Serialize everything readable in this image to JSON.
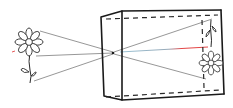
{
  "diagram": {
    "title": "",
    "objects": [
      {
        "id": "object-flower",
        "orientation": "upright",
        "position": "left"
      },
      {
        "id": "image-flower",
        "orientation": "inverted",
        "position": "back-screen"
      }
    ],
    "rays": [
      {
        "from": "flower-top",
        "to": "image-bottom"
      },
      {
        "from": "flower-center",
        "to": "image-center",
        "highlight": true
      },
      {
        "from": "flower-stem-base",
        "to": "image-top"
      }
    ],
    "colors": {
      "outline": "#1a1a1a",
      "ray": "#6a6a6a",
      "central_ray_start": "#7fb0c8",
      "central_ray_end": "#e03030",
      "background": "#ffffff"
    }
  }
}
